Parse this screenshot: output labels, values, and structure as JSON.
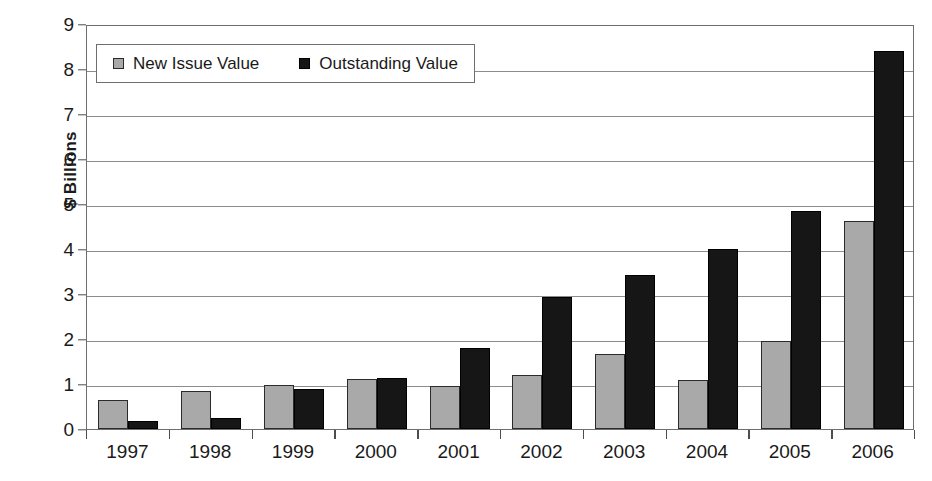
{
  "chart_data": {
    "type": "bar",
    "title": "",
    "subtitle": "",
    "xlabel": "",
    "ylabel": "$ Billions",
    "ylim": [
      0,
      9
    ],
    "ytick_step": 1,
    "yticks": [
      "0",
      "1",
      "2",
      "3",
      "4",
      "5",
      "6",
      "7",
      "8",
      "9"
    ],
    "grid": true,
    "grid_axis": "y",
    "legend_position": "top-left-inside",
    "categories": [
      "1997",
      "1998",
      "1999",
      "2000",
      "2001",
      "2002",
      "2003",
      "2004",
      "2005",
      "2006"
    ],
    "series": [
      {
        "name": "New Issue Value",
        "color": "#a9a9a9",
        "values": [
          0.64,
          0.84,
          0.98,
          1.11,
          0.95,
          1.19,
          1.67,
          1.09,
          1.95,
          4.63
        ]
      },
      {
        "name": "Outstanding Value",
        "color": "#161616",
        "values": [
          0.17,
          0.24,
          0.88,
          1.13,
          1.8,
          2.93,
          3.42,
          4.0,
          4.85,
          8.4
        ]
      }
    ]
  },
  "legend": {
    "entries": [
      {
        "label": "New Issue Value",
        "swatch": "new-issue"
      },
      {
        "label": "Outstanding Value",
        "swatch": "outstanding"
      }
    ]
  },
  "colors": {
    "new_issue": "#a9a9a9",
    "outstanding": "#161616",
    "axis": "#6e6e6e",
    "gridline": "#8c8c8c",
    "background": "#ffffff"
  }
}
